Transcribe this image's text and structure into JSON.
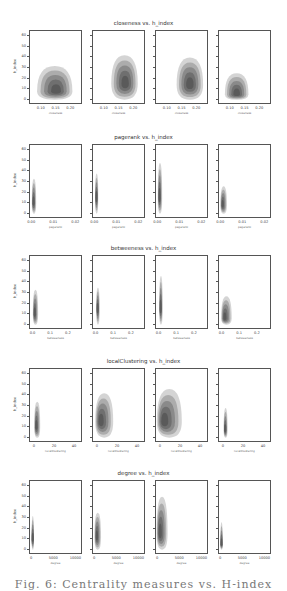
{
  "figure": {
    "caption": "Fig. 6: Centrality measures vs. H-index"
  },
  "chart_data": [
    {
      "type": "heatmap",
      "kind": "kde-contour",
      "title": "closeness vs. h_index",
      "ylabel": "h_index",
      "xlabel": "closeness",
      "yticks": [
        0,
        10,
        20,
        30,
        40,
        50,
        60
      ],
      "ylim": [
        -5,
        65
      ],
      "xticks": [
        "0.10",
        "0.15",
        "0.20"
      ],
      "xlim": [
        0.06,
        0.24
      ],
      "panels": [
        {
          "peak": [
            0.15,
            8
          ],
          "x_range": [
            0.08,
            0.2
          ],
          "y_range": [
            0,
            32
          ]
        },
        {
          "peak": [
            0.17,
            15
          ],
          "x_range": [
            0.12,
            0.21
          ],
          "y_range": [
            0,
            42
          ]
        },
        {
          "peak": [
            0.175,
            14
          ],
          "x_range": [
            0.13,
            0.22
          ],
          "y_range": [
            0,
            40
          ]
        },
        {
          "peak": [
            0.12,
            5
          ],
          "x_range": [
            0.08,
            0.16
          ],
          "y_range": [
            0,
            25
          ]
        }
      ]
    },
    {
      "type": "heatmap",
      "kind": "kde-contour",
      "title": "pagerank vs. h_index",
      "ylabel": "h_index",
      "xlabel": "pagerank",
      "yticks": [
        0,
        10,
        20,
        30,
        40,
        50,
        60
      ],
      "ylim": [
        -5,
        65
      ],
      "xticks": [
        "0.00",
        "0.01",
        "0.02"
      ],
      "xlim": [
        -0.001,
        0.023
      ],
      "panels": [
        {
          "peak": [
            0.0005,
            10
          ],
          "x_range": [
            0,
            0.002
          ],
          "y_range": [
            0,
            33
          ]
        },
        {
          "peak": [
            0.0005,
            15
          ],
          "x_range": [
            0,
            0.0015
          ],
          "y_range": [
            0,
            38
          ]
        },
        {
          "peak": [
            0.0005,
            15
          ],
          "x_range": [
            0,
            0.002
          ],
          "y_range": [
            0,
            48
          ]
        },
        {
          "peak": [
            0.0005,
            8
          ],
          "x_range": [
            0,
            0.003
          ],
          "y_range": [
            0,
            26
          ]
        }
      ]
    },
    {
      "type": "heatmap",
      "kind": "kde-contour",
      "title": "betweeness vs. h_index",
      "ylabel": "h_index",
      "xlabel": "betweeness",
      "yticks": [
        0,
        10,
        20,
        30,
        40,
        50,
        60
      ],
      "ylim": [
        -5,
        65
      ],
      "xticks": [
        "0.0",
        "0.1",
        "0.2"
      ],
      "xlim": [
        -0.02,
        0.28
      ],
      "panels": [
        {
          "peak": [
            0.005,
            10
          ],
          "x_range": [
            0,
            0.03
          ],
          "y_range": [
            0,
            33
          ]
        },
        {
          "peak": [
            0.005,
            15
          ],
          "x_range": [
            0,
            0.02
          ],
          "y_range": [
            0,
            35
          ]
        },
        {
          "peak": [
            0.005,
            15
          ],
          "x_range": [
            0,
            0.02
          ],
          "y_range": [
            0,
            46
          ]
        },
        {
          "peak": [
            0.01,
            6
          ],
          "x_range": [
            0,
            0.06
          ],
          "y_range": [
            0,
            27
          ]
        }
      ]
    },
    {
      "type": "heatmap",
      "kind": "kde-contour",
      "title": "localClustering vs. h_index",
      "ylabel": "h_index",
      "xlabel": "localClustering",
      "yticks": [
        0,
        10,
        20,
        30,
        40,
        50,
        60
      ],
      "ylim": [
        -5,
        65
      ],
      "xticks": [
        "0",
        "20",
        "40"
      ],
      "xlim": [
        -5,
        48
      ],
      "panels": [
        {
          "peak": [
            1,
            10
          ],
          "x_range": [
            0,
            6
          ],
          "y_range": [
            0,
            34
          ]
        },
        {
          "peak": [
            2,
            15
          ],
          "x_range": [
            0,
            18
          ],
          "y_range": [
            0,
            42
          ]
        },
        {
          "peak": [
            2,
            15
          ],
          "x_range": [
            0,
            25
          ],
          "y_range": [
            0,
            46
          ]
        },
        {
          "peak": [
            1,
            7
          ],
          "x_range": [
            0,
            4
          ],
          "y_range": [
            0,
            28
          ]
        }
      ]
    },
    {
      "type": "heatmap",
      "kind": "kde-contour",
      "title": "degree vs. h_index",
      "ylabel": "h_index",
      "xlabel": "degree",
      "yticks": [
        0,
        10,
        20,
        30,
        40,
        50,
        60
      ],
      "ylim": [
        -5,
        65
      ],
      "xticks": [
        "0",
        "5000",
        "10000"
      ],
      "xlim": [
        -500,
        11500
      ],
      "panels": [
        {
          "peak": [
            100,
            10
          ],
          "x_range": [
            0,
            300
          ],
          "y_range": [
            0,
            32
          ]
        },
        {
          "peak": [
            300,
            12
          ],
          "x_range": [
            0,
            1500
          ],
          "y_range": [
            0,
            35
          ]
        },
        {
          "peak": [
            300,
            15
          ],
          "x_range": [
            0,
            2500
          ],
          "y_range": [
            0,
            50
          ]
        },
        {
          "peak": [
            50,
            5
          ],
          "x_range": [
            0,
            200
          ],
          "y_range": [
            0,
            26
          ]
        }
      ]
    }
  ],
  "rows": [
    {
      "title": "closeness vs. h_index",
      "xlabel": "closeness",
      "ylabel": "h_index",
      "xticks": [
        "0.10",
        "0.15",
        "0.20"
      ],
      "yticks": [
        "0",
        "10",
        "20",
        "30",
        "40",
        "50",
        "60"
      ]
    },
    {
      "title": "pagerank vs. h_index",
      "xlabel": "pagerank",
      "ylabel": "h_index",
      "xticks": [
        "0.00",
        "0.01",
        "0.02"
      ],
      "yticks": [
        "0",
        "10",
        "20",
        "30",
        "40",
        "50",
        "60"
      ]
    },
    {
      "title": "betweeness vs. h_index",
      "xlabel": "betweeness",
      "ylabel": "h_index",
      "xticks": [
        "0.0",
        "0.1",
        "0.2"
      ],
      "yticks": [
        "0",
        "10",
        "20",
        "30",
        "40",
        "50",
        "60"
      ]
    },
    {
      "title": "localClustering vs. h_index",
      "xlabel": "localClustering",
      "ylabel": "h_index",
      "xticks": [
        "0",
        "20",
        "40"
      ],
      "yticks": [
        "0",
        "10",
        "20",
        "30",
        "40",
        "50",
        "60"
      ]
    },
    {
      "title": "degree vs. h_index",
      "xlabel": "degree",
      "ylabel": "h_index",
      "xticks": [
        "0",
        "5000",
        "10000"
      ],
      "yticks": [
        "0",
        "10",
        "20",
        "30",
        "40",
        "50",
        "60"
      ]
    }
  ]
}
